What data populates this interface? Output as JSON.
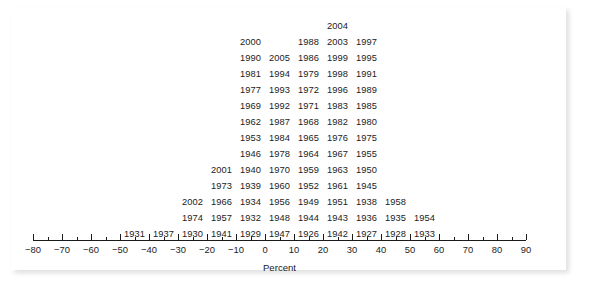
{
  "chart_data": {
    "type": "table",
    "plot_kind": "stacked-dot-plot-with-year-labels",
    "title": "",
    "subtitle": "",
    "xlabel": "Percent",
    "ylabel": "",
    "xlim": [
      -80,
      90
    ],
    "xtick_step": 10,
    "xticks": [
      -80,
      -70,
      -60,
      -50,
      -40,
      -30,
      -20,
      -10,
      0,
      10,
      20,
      30,
      40,
      50,
      60,
      70,
      80,
      90
    ],
    "xtick_labels": [
      "−80",
      "−70",
      "−60",
      "−50",
      "−40",
      "−30",
      "−20",
      "−10",
      "0",
      "10",
      "20",
      "30",
      "40",
      "50",
      "60",
      "70",
      "80",
      "90"
    ],
    "grid": false,
    "legend": null,
    "bin_width": 10,
    "bins": [
      {
        "bin_start": -50,
        "bin_end": -40,
        "center": -45,
        "count": 1,
        "years": [
          "1931"
        ]
      },
      {
        "bin_start": -40,
        "bin_end": -30,
        "center": -35,
        "count": 1,
        "years": [
          "1937"
        ]
      },
      {
        "bin_start": -30,
        "bin_end": -20,
        "center": -25,
        "count": 4,
        "years": [
          "1930",
          "1974",
          "2002",
          "1973"
        ]
      },
      {
        "bin_start": -20,
        "bin_end": -10,
        "center": -15,
        "count": 5,
        "years": [
          "1941",
          "1957",
          "1966",
          "1939",
          "2001"
        ]
      },
      {
        "bin_start": -10,
        "bin_end": 0,
        "center": -5,
        "count": 14,
        "years": [
          "1929",
          "1932",
          "1934",
          "1940",
          "1946",
          "1953",
          "1962",
          "1969",
          "1977",
          "1981",
          "1990",
          "2000",
          "1973_x",
          "1977_x"
        ]
      },
      {
        "bin_start": 0,
        "bin_end": 10,
        "center": 5,
        "count": 12,
        "years": [
          "1947",
          "1948",
          "1956",
          "1960",
          "1970",
          "1978",
          "1984",
          "1992",
          "1993",
          "1994",
          "2005"
        ]
      },
      {
        "bin_start": 10,
        "bin_end": 20,
        "center": 15,
        "count": 13,
        "years": [
          "1926",
          "1944",
          "1949",
          "1952",
          "1959",
          "1964",
          "1965",
          "1968",
          "1971",
          "1972",
          "1979",
          "1986",
          "1988"
        ]
      },
      {
        "bin_start": 20,
        "bin_end": 30,
        "center": 25,
        "count": 14,
        "years": [
          "1942",
          "1943",
          "1951",
          "1961",
          "1963",
          "1967",
          "1976",
          "1982",
          "1983",
          "1996",
          "1998",
          "1999",
          "2003",
          "2004"
        ]
      },
      {
        "bin_start": 30,
        "bin_end": 40,
        "center": 35,
        "count": 13,
        "years": [
          "1927",
          "1936",
          "1938",
          "1945",
          "1950",
          "1955",
          "1975",
          "1980",
          "1985",
          "1989",
          "1991",
          "1995",
          "1997"
        ]
      },
      {
        "bin_start": 40,
        "bin_end": 50,
        "center": 45,
        "count": 2,
        "years": [
          "1928",
          "1935"
        ]
      },
      {
        "bin_start": 50,
        "bin_end": 60,
        "center": 55,
        "count": 2,
        "years": [
          "1933",
          "1954"
        ]
      }
    ],
    "columns": [
      {
        "center": -45,
        "years_bottom_to_top": [
          "1931"
        ]
      },
      {
        "center": -35,
        "years_bottom_to_top": [
          "1937"
        ]
      },
      {
        "center": -25,
        "years_bottom_to_top": [
          "1930",
          "1974",
          "2002"
        ]
      },
      {
        "center": -15,
        "years_bottom_to_top": [
          "1941",
          "1957",
          "1966",
          "1973",
          "2001"
        ]
      },
      {
        "center": -5,
        "years_bottom_to_top": [
          "1929",
          "1932",
          "1934",
          "1939",
          "1940",
          "1946",
          "1953",
          "1962",
          "1969",
          "1977",
          "1981",
          "1990",
          "2000"
        ]
      },
      {
        "center": 5,
        "years_bottom_to_top": [
          "1947",
          "1948",
          "1956",
          "1960",
          "1970",
          "1978",
          "1984",
          "1992",
          "1993",
          "1994",
          "2005"
        ]
      },
      {
        "center": 15,
        "years_bottom_to_top": [
          "1926",
          "1944",
          "1949",
          "1952",
          "1959",
          "1964",
          "1965",
          "1968",
          "1971",
          "1972",
          "1979",
          "1986",
          "1988"
        ]
      },
      {
        "center": 25,
        "years_bottom_to_top": [
          "1942",
          "1943",
          "1951",
          "1961",
          "1963",
          "1967",
          "1976",
          "1982",
          "1983",
          "1996",
          "1998",
          "1999",
          "2003",
          "2004"
        ]
      },
      {
        "center": 35,
        "years_bottom_to_top": [
          "1927",
          "1936",
          "1938",
          "1945",
          "1950",
          "1955",
          "1975",
          "1980",
          "1985",
          "1989",
          "1991",
          "1995",
          "1997"
        ]
      },
      {
        "center": 45,
        "years_bottom_to_top": [
          "1928",
          "1935"
        ]
      },
      {
        "center": 55,
        "years_bottom_to_top": [
          "1933",
          "1954"
        ]
      }
    ],
    "rows_top_to_bottom": [
      {
        "row": 0,
        "cells": [
          {
            "center": 25,
            "year": "2004"
          }
        ]
      },
      {
        "row": 1,
        "cells": [
          {
            "center": -5,
            "year": "2000"
          },
          {
            "center": 15,
            "year": "1988"
          },
          {
            "center": 25,
            "year": "2003"
          },
          {
            "center": 35,
            "year": "1997"
          }
        ]
      },
      {
        "row": 2,
        "cells": [
          {
            "center": -5,
            "year": "1990"
          },
          {
            "center": 5,
            "year": "2005"
          },
          {
            "center": 15,
            "year": "1986"
          },
          {
            "center": 25,
            "year": "1999"
          },
          {
            "center": 35,
            "year": "1995"
          }
        ]
      },
      {
        "row": 3,
        "cells": [
          {
            "center": -5,
            "year": "1981"
          },
          {
            "center": 5,
            "year": "1994"
          },
          {
            "center": 15,
            "year": "1979"
          },
          {
            "center": 25,
            "year": "1998"
          },
          {
            "center": 35,
            "year": "1991"
          }
        ]
      },
      {
        "row": 4,
        "cells": [
          {
            "center": -5,
            "year": "1977"
          },
          {
            "center": 5,
            "year": "1993"
          },
          {
            "center": 15,
            "year": "1972"
          },
          {
            "center": 25,
            "year": "1996"
          },
          {
            "center": 35,
            "year": "1989"
          }
        ]
      },
      {
        "row": 5,
        "cells": [
          {
            "center": -5,
            "year": "1969"
          },
          {
            "center": 5,
            "year": "1992"
          },
          {
            "center": 15,
            "year": "1971"
          },
          {
            "center": 25,
            "year": "1983"
          },
          {
            "center": 35,
            "year": "1985"
          }
        ]
      },
      {
        "row": 6,
        "cells": [
          {
            "center": -5,
            "year": "1962"
          },
          {
            "center": 5,
            "year": "1987"
          },
          {
            "center": 15,
            "year": "1968"
          },
          {
            "center": 25,
            "year": "1982"
          },
          {
            "center": 35,
            "year": "1980"
          }
        ]
      },
      {
        "row": 7,
        "cells": [
          {
            "center": -5,
            "year": "1953"
          },
          {
            "center": 5,
            "year": "1984"
          },
          {
            "center": 15,
            "year": "1965"
          },
          {
            "center": 25,
            "year": "1976"
          },
          {
            "center": 35,
            "year": "1975"
          }
        ]
      },
      {
        "row": 8,
        "cells": [
          {
            "center": -5,
            "year": "1946"
          },
          {
            "center": 5,
            "year": "1978"
          },
          {
            "center": 15,
            "year": "1964"
          },
          {
            "center": 25,
            "year": "1967"
          },
          {
            "center": 35,
            "year": "1955"
          }
        ]
      },
      {
        "row": 9,
        "cells": [
          {
            "center": -15,
            "year": "2001"
          },
          {
            "center": -5,
            "year": "1940"
          },
          {
            "center": 5,
            "year": "1970"
          },
          {
            "center": 15,
            "year": "1959"
          },
          {
            "center": 25,
            "year": "1963"
          },
          {
            "center": 35,
            "year": "1950"
          }
        ]
      },
      {
        "row": 10,
        "cells": [
          {
            "center": -15,
            "year": "1973"
          },
          {
            "center": -5,
            "year": "1939"
          },
          {
            "center": 5,
            "year": "1960"
          },
          {
            "center": 15,
            "year": "1952"
          },
          {
            "center": 25,
            "year": "1961"
          },
          {
            "center": 35,
            "year": "1945"
          }
        ]
      },
      {
        "row": 11,
        "cells": [
          {
            "center": -25,
            "year": "2002"
          },
          {
            "center": -15,
            "year": "1966"
          },
          {
            "center": -5,
            "year": "1934"
          },
          {
            "center": 5,
            "year": "1956"
          },
          {
            "center": 15,
            "year": "1949"
          },
          {
            "center": 25,
            "year": "1951"
          },
          {
            "center": 35,
            "year": "1938"
          },
          {
            "center": 45,
            "year": "1958"
          }
        ]
      },
      {
        "row": 12,
        "cells": [
          {
            "center": -25,
            "year": "1974"
          },
          {
            "center": -15,
            "year": "1957"
          },
          {
            "center": -5,
            "year": "1932"
          },
          {
            "center": 5,
            "year": "1948"
          },
          {
            "center": 15,
            "year": "1944"
          },
          {
            "center": 25,
            "year": "1943"
          },
          {
            "center": 35,
            "year": "1936"
          },
          {
            "center": 45,
            "year": "1935"
          },
          {
            "center": 55,
            "year": "1954"
          }
        ]
      },
      {
        "row": 13,
        "cells": [
          {
            "center": -45,
            "year": "1931"
          },
          {
            "center": -35,
            "year": "1937"
          },
          {
            "center": -25,
            "year": "1930"
          },
          {
            "center": -15,
            "year": "1941"
          },
          {
            "center": -5,
            "year": "1929"
          },
          {
            "center": 5,
            "year": "1947"
          },
          {
            "center": 15,
            "year": "1926"
          },
          {
            "center": 25,
            "year": "1942"
          },
          {
            "center": 35,
            "year": "1927"
          },
          {
            "center": 45,
            "year": "1928"
          },
          {
            "center": 55,
            "year": "1933"
          }
        ]
      }
    ],
    "colors": {
      "text": "#1b1b1b",
      "axis_line": "#1b1b1b",
      "background": "#ffffff"
    }
  }
}
